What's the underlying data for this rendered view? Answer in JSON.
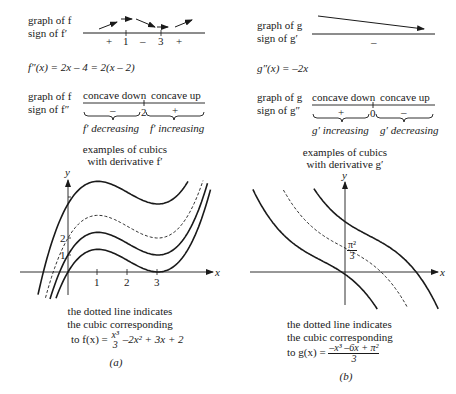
{
  "panel_a": {
    "row1": {
      "label_graph": "graph of f",
      "label_sign": "sign of f′",
      "signs": [
        "+",
        "1",
        "–",
        "3",
        "+"
      ]
    },
    "second_derivative": "f″(x) = 2x – 4 = 2(x – 2)",
    "row2": {
      "label_graph": "graph of f",
      "label_sign": "sign of f″",
      "concave_left": "concave down",
      "concave_right": "concave up",
      "sign_left": "–",
      "sign_mid": "2",
      "sign_right": "+",
      "brace_left": "f′ decreasing",
      "brace_right": "f′ increasing"
    },
    "plot_title_1": "examples of cubics",
    "plot_title_2": "with derivative f′",
    "axis_x": "x",
    "axis_y": "y",
    "ticks_x": [
      "1",
      "2",
      "3"
    ],
    "ticks_y": [
      "1",
      "2"
    ],
    "note_1": "the dotted line indicates",
    "note_2": "the cubic corresponding",
    "note_3_prefix": "to f(x) =",
    "note_3_frac_num": "x³",
    "note_3_frac_den": "3",
    "note_3_suffix": "–2x² + 3x + 2",
    "caption": "(a)"
  },
  "panel_b": {
    "row1": {
      "label_graph": "graph of g",
      "label_sign": "sign of g′",
      "signs": [
        "–"
      ]
    },
    "second_derivative": "g″(x) = –2x",
    "row2": {
      "label_graph": "graph of g",
      "label_sign": "sign of g″",
      "concave_left": "concave down",
      "concave_right": "concave up",
      "sign_left": "+",
      "sign_mid": "0",
      "sign_right": "–",
      "brace_left": "g′ increasing",
      "brace_right": "g′ decreasing"
    },
    "plot_title_1": "examples of cubics",
    "plot_title_2": "with derivative g′",
    "axis_x": "x",
    "axis_y": "y",
    "y_intercept_num": "π²",
    "y_intercept_den": "3",
    "note_1": "the dotted line indicates",
    "note_2": "the cubic corresponding",
    "note_3_prefix": "to g(x) =",
    "note_3_frac_num": "–x³ –6x + π²",
    "note_3_frac_den": "3",
    "caption": "(b)"
  },
  "chart_data": [
    {
      "type": "line",
      "title": "examples of cubics with derivative f′",
      "xlabel": "x",
      "ylabel": "y",
      "xticks": [
        1,
        2,
        3
      ],
      "yticks": [
        1,
        2
      ],
      "xlim": [
        -1.2,
        4.8
      ],
      "ylim": [
        -2.0,
        8.0
      ],
      "series": [
        {
          "name": "x^3/3 - 2x^2 + 3x + 4",
          "style": "solid",
          "C": 4
        },
        {
          "name": "f(x) = x^3/3 - 2x^2 + 3x + 2",
          "style": "dashed",
          "C": 2
        },
        {
          "name": "x^3/3 - 2x^2 + 3x + 1",
          "style": "solid",
          "C": 1
        },
        {
          "name": "x^3/3 - 2x^2 + 3x",
          "style": "solid",
          "C": 0
        }
      ]
    },
    {
      "type": "line",
      "title": "examples of cubics with derivative g′",
      "xlabel": "x",
      "ylabel": "y",
      "annotations": [
        "π²/3 (y-intercept)"
      ],
      "series": [
        {
          "name": "g(x) + 1.7",
          "style": "solid",
          "C": 1.7
        },
        {
          "name": "g(x) = (-x^3 - 6x + π^2)/3",
          "style": "dashed",
          "C": 0
        },
        {
          "name": "g(x) - 1.7",
          "style": "solid",
          "C": -1.7
        }
      ]
    }
  ]
}
